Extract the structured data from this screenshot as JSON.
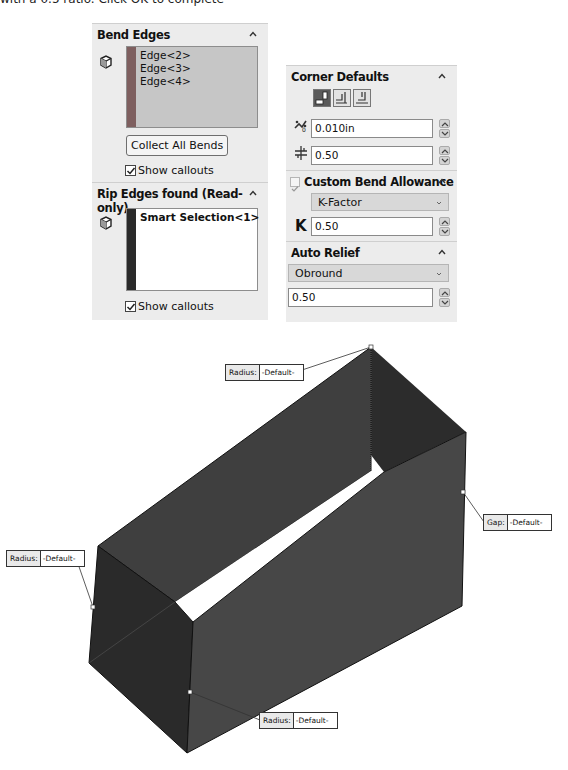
{
  "top_text": "with a 0.5 ratio. Click OK to complete",
  "bend_edges": {
    "title": "Bend Edges",
    "items": [
      "Edge<2>",
      "Edge<3>",
      "Edge<4>"
    ],
    "collect_button": "Collect All Bends",
    "show_callouts_label": "Show callouts",
    "show_callouts_checked": true,
    "stripe_color": "#7e5f5f",
    "list_bg": "#c6c6c6"
  },
  "rip_edges": {
    "title": "Rip Edges found (Read-only)",
    "items": [
      "Smart Selection<1>"
    ],
    "show_callouts_label": "Show callouts",
    "show_callouts_checked": true,
    "stripe_color": "#2a2a2a",
    "list_bg": "#ffffff"
  },
  "corner_defaults": {
    "title": "Corner Defaults",
    "corner_types": [
      "open-corner",
      "overlap-corner",
      "underlap-corner"
    ],
    "selected_corner": 0,
    "gap_value": "0.010in",
    "overlap_ratio_value": "0.50"
  },
  "custom_bend_allowance": {
    "title": "Custom Bend Allowance",
    "checked": true,
    "type_selected": "K-Factor",
    "k_label": "K",
    "k_value": "0.50"
  },
  "auto_relief": {
    "title": "Auto Relief",
    "type_selected": "Obround",
    "ratio_value": "0.50"
  },
  "callouts": [
    {
      "label": "Radius:",
      "value": "-Default-"
    },
    {
      "label": "Gap:",
      "value": "-Default-"
    },
    {
      "label": "Radius:",
      "value": "-Default-"
    },
    {
      "label": "Radius:",
      "value": "-Default-"
    }
  ],
  "colors": {
    "panel_bg": "#ececec",
    "face_dark": "#2e2e2e",
    "face_mid": "#434343",
    "face_light": "#4a4a4a"
  }
}
